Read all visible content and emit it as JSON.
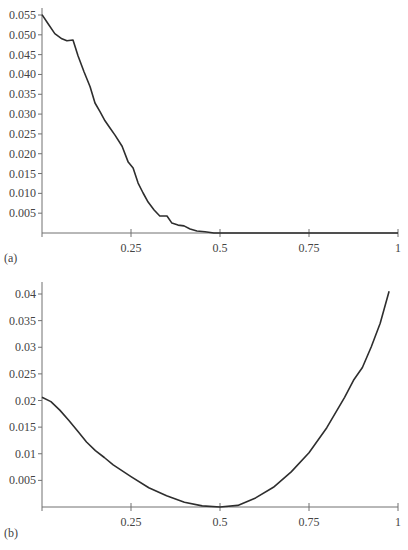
{
  "chart_data": [
    {
      "type": "line",
      "panel_label": "(a)",
      "title": "",
      "xlabel": "",
      "ylabel": "",
      "xlim": [
        0,
        1
      ],
      "ylim": [
        0,
        0.055
      ],
      "grid": false,
      "legend": null,
      "xticks": [
        "0.25",
        "0.5",
        "0.75",
        "1"
      ],
      "yticks": [
        "0.005",
        "0.010",
        "0.015",
        "0.020",
        "0.025",
        "0.030",
        "0.035",
        "0.040",
        "0.045",
        "0.050",
        "0.055"
      ],
      "x": [
        0.0,
        0.017,
        0.036,
        0.056,
        0.07,
        0.087,
        0.101,
        0.118,
        0.135,
        0.149,
        0.163,
        0.177,
        0.191,
        0.205,
        0.225,
        0.242,
        0.256,
        0.27,
        0.284,
        0.298,
        0.315,
        0.331,
        0.351,
        0.365,
        0.382,
        0.399,
        0.416,
        0.435,
        0.458,
        0.483,
        1.0
      ],
      "values": [
        0.0551,
        0.0528,
        0.0503,
        0.049,
        0.0485,
        0.0487,
        0.0447,
        0.0407,
        0.0369,
        0.0328,
        0.0306,
        0.0283,
        0.0265,
        0.0247,
        0.0219,
        0.0179,
        0.0164,
        0.0126,
        0.0101,
        0.0078,
        0.0058,
        0.0043,
        0.0043,
        0.0025,
        0.002,
        0.0018,
        0.001,
        0.0005,
        0.0003,
        0.0,
        0.0
      ]
    },
    {
      "type": "line",
      "panel_label": "(b)",
      "title": "",
      "xlabel": "",
      "ylabel": "",
      "xlim": [
        0,
        1
      ],
      "ylim": [
        0,
        0.04
      ],
      "grid": false,
      "legend": null,
      "xticks": [
        "0.25",
        "0.5",
        "0.75",
        "1"
      ],
      "yticks": [
        "0.005",
        "0.01",
        "0.015",
        "0.02",
        "0.025",
        "0.03",
        "0.035",
        "0.04"
      ],
      "x": [
        0.0,
        0.025,
        0.05,
        0.075,
        0.1,
        0.125,
        0.15,
        0.175,
        0.2,
        0.25,
        0.3,
        0.35,
        0.4,
        0.45,
        0.5,
        0.55,
        0.6,
        0.65,
        0.7,
        0.75,
        0.8,
        0.85,
        0.875,
        0.9,
        0.925,
        0.95,
        0.975
      ],
      "values": [
        0.0206,
        0.0198,
        0.0182,
        0.0163,
        0.0143,
        0.0122,
        0.0106,
        0.0093,
        0.0079,
        0.0057,
        0.0036,
        0.0021,
        0.0009,
        0.0002,
        0.0,
        0.0003,
        0.0017,
        0.0037,
        0.0066,
        0.0102,
        0.0149,
        0.0206,
        0.0238,
        0.0262,
        0.0301,
        0.0345,
        0.0405
      ]
    }
  ]
}
